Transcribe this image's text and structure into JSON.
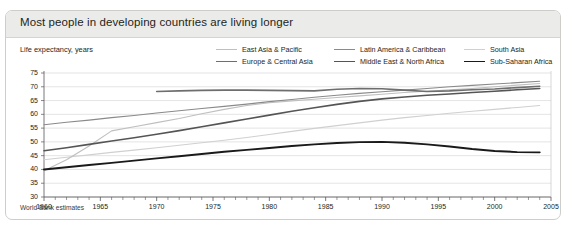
{
  "card": {
    "title": "Most people in developing countries are living longer",
    "source_note": "World Bank estimates"
  },
  "axis_label": "Life expectancy, years",
  "legend": {
    "items": [
      {
        "label": "East Asia & Pacific",
        "color": "#bfbfbf",
        "width": 1.1
      },
      {
        "label": "Latin America & Caribbean",
        "color": "#8a8a8a",
        "width": 1.1
      },
      {
        "label": "South Asia",
        "color": "#d0d0d0",
        "width": 1.1
      },
      {
        "label": "Europe & Central Asia",
        "color": "#6e6e6e",
        "width": 1.6
      },
      {
        "label": "Middle East & North Africa",
        "color": "#555555",
        "width": 1.6
      },
      {
        "label": "Sub-Saharan Africa",
        "color": "#1a1a1a",
        "width": 1.9
      }
    ]
  },
  "chart_data": {
    "type": "line",
    "title": "Most people in developing countries are living longer",
    "xlabel": "",
    "ylabel": "Life expectancy, years",
    "xlim": [
      1960,
      2005
    ],
    "ylim": [
      30,
      75
    ],
    "yticks": [
      30,
      35,
      40,
      45,
      50,
      55,
      60,
      65,
      70,
      75
    ],
    "xticks": [
      1960,
      1965,
      1970,
      1975,
      1980,
      1985,
      1990,
      1995,
      2000,
      2005
    ],
    "xtick_minor_step": 1,
    "grid": "horizontal",
    "legend_position": "top-right",
    "annotations": [
      "World Bank estimates"
    ],
    "series": [
      {
        "name": "East Asia & Pacific",
        "color": "#bfbfbf",
        "x": [
          1960,
          1962,
          1964,
          1966,
          1968,
          1970,
          1972,
          1974,
          1976,
          1978,
          1980,
          1982,
          1984,
          1986,
          1988,
          1990,
          1992,
          1994,
          1996,
          1998,
          2000,
          2002,
          2004
        ],
        "values": [
          39.5,
          43.5,
          48.5,
          54.0,
          55.5,
          57.0,
          58.5,
          60.2,
          61.8,
          63.2,
          64.2,
          64.9,
          65.5,
          66.1,
          66.7,
          67.3,
          67.9,
          68.4,
          68.9,
          69.4,
          70.0,
          70.6,
          71.2
        ]
      },
      {
        "name": "Latin America & Caribbean",
        "color": "#8a8a8a",
        "x": [
          1960,
          1962,
          1964,
          1966,
          1968,
          1970,
          1972,
          1974,
          1976,
          1978,
          1980,
          1982,
          1984,
          1986,
          1988,
          1990,
          1992,
          1994,
          1996,
          1998,
          2000,
          2002,
          2004
        ],
        "values": [
          56.2,
          57.1,
          57.9,
          58.8,
          59.6,
          60.5,
          61.3,
          62.1,
          62.9,
          63.7,
          64.6,
          65.4,
          66.2,
          66.9,
          67.6,
          68.2,
          68.8,
          69.4,
          70.0,
          70.5,
          71.0,
          71.5,
          72.0
        ]
      },
      {
        "name": "South Asia",
        "color": "#d0d0d0",
        "x": [
          1960,
          1962,
          1964,
          1966,
          1968,
          1970,
          1972,
          1974,
          1976,
          1978,
          1980,
          1982,
          1984,
          1986,
          1988,
          1990,
          1992,
          1994,
          1996,
          1998,
          2000,
          2002,
          2004
        ],
        "values": [
          43.5,
          44.4,
          45.3,
          46.2,
          47.0,
          47.9,
          48.8,
          49.7,
          50.6,
          51.6,
          52.7,
          53.8,
          54.9,
          55.9,
          56.9,
          57.9,
          58.8,
          59.6,
          60.4,
          61.1,
          61.8,
          62.5,
          63.2
        ]
      },
      {
        "name": "Europe & Central Asia",
        "color": "#6e6e6e",
        "x": [
          1970,
          1972,
          1974,
          1976,
          1978,
          1980,
          1982,
          1984,
          1986,
          1988,
          1990,
          1992,
          1994,
          1996,
          1998,
          2000,
          2002,
          2004
        ],
        "values": [
          68.3,
          68.5,
          68.7,
          68.8,
          68.8,
          68.7,
          68.6,
          68.5,
          69.1,
          69.4,
          69.3,
          68.8,
          68.3,
          68.5,
          68.9,
          69.2,
          69.7,
          70.2
        ]
      },
      {
        "name": "Middle East & North Africa",
        "color": "#555555",
        "x": [
          1960,
          1962,
          1964,
          1966,
          1968,
          1970,
          1972,
          1974,
          1976,
          1978,
          1980,
          1982,
          1984,
          1986,
          1988,
          1990,
          1992,
          1994,
          1996,
          1998,
          2000,
          2002,
          2004
        ],
        "values": [
          46.8,
          47.9,
          49.1,
          50.3,
          51.5,
          52.8,
          54.1,
          55.5,
          56.9,
          58.3,
          59.7,
          61.1,
          62.4,
          63.6,
          64.7,
          65.6,
          66.3,
          66.9,
          67.4,
          67.9,
          68.4,
          68.9,
          69.4
        ]
      },
      {
        "name": "Sub-Saharan Africa",
        "color": "#1a1a1a",
        "x": [
          1960,
          1962,
          1964,
          1966,
          1968,
          1970,
          1972,
          1974,
          1976,
          1978,
          1980,
          1982,
          1984,
          1986,
          1988,
          1990,
          1992,
          1994,
          1996,
          1998,
          2000,
          2002,
          2004
        ],
        "values": [
          40.0,
          40.8,
          41.6,
          42.4,
          43.2,
          44.0,
          44.8,
          45.6,
          46.4,
          47.1,
          47.8,
          48.5,
          49.1,
          49.6,
          49.9,
          50.0,
          49.7,
          49.1,
          48.3,
          47.4,
          46.7,
          46.3,
          46.2
        ]
      }
    ]
  }
}
